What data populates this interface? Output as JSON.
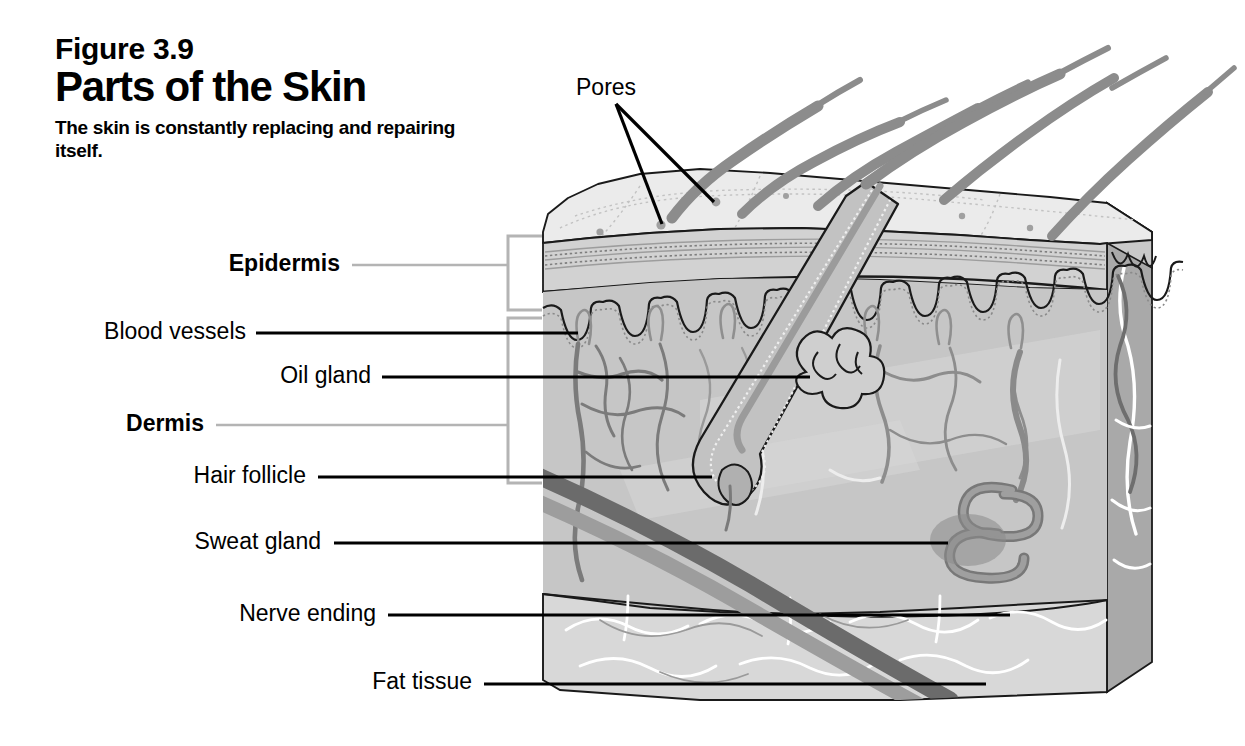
{
  "figure": {
    "number": "Figure 3.9",
    "title": "Parts of the Skin",
    "subtitle": "The skin is constantly replacing and repairing itself."
  },
  "colors": {
    "background": "#ffffff",
    "ink": "#000000",
    "leader_line": "#000000",
    "bracket_line": "#b4b4b4",
    "surface_top": "#ebebeb",
    "epidermis_band": "#b9b9b9",
    "epidermis_band_light": "#d2d2d2",
    "dermis": "#c6c6c6",
    "dermis_light": "#d0d0d0",
    "fat_tissue": "#d6d6d6",
    "side_face": "#a9a9a9",
    "hair": "#8c8c8c",
    "vessel_dark": "#6e6e6e",
    "vessel_mid": "#8f8f8f",
    "vessel_light": "#ffffff",
    "gland_dark": "#848484",
    "pore_dot": "#a0a0a0"
  },
  "labels": [
    {
      "id": "pores",
      "text": "Pores",
      "bold": false,
      "align": "left",
      "x": 576,
      "y": 76,
      "leader": "fan-black"
    },
    {
      "id": "epidermis",
      "text": "Epidermis",
      "bold": true,
      "align": "right",
      "x": 340,
      "y": 252,
      "leader": "gray"
    },
    {
      "id": "blood-vessels",
      "text": "Blood vessels",
      "bold": false,
      "align": "right",
      "x": 246,
      "y": 325,
      "leader": "black"
    },
    {
      "id": "oil-gland",
      "text": "Oil gland",
      "bold": false,
      "align": "right",
      "x": 371,
      "y": 366,
      "leader": "black"
    },
    {
      "id": "dermis",
      "text": "Dermis",
      "bold": true,
      "align": "right",
      "x": 204,
      "y": 415,
      "leader": "gray"
    },
    {
      "id": "hair-follicle",
      "text": "Hair follicle",
      "bold": false,
      "align": "right",
      "x": 306,
      "y": 467,
      "leader": "black"
    },
    {
      "id": "sweat-gland",
      "text": "Sweat gland",
      "bold": false,
      "align": "right",
      "x": 321,
      "y": 532,
      "leader": "black"
    },
    {
      "id": "nerve-ending",
      "text": "Nerve ending",
      "bold": false,
      "align": "right",
      "x": 376,
      "y": 605,
      "leader": "black"
    },
    {
      "id": "fat-tissue",
      "text": "Fat tissue",
      "bold": false,
      "align": "right",
      "x": 472,
      "y": 673,
      "leader": "black"
    }
  ],
  "brackets": [
    {
      "id": "epidermis-bracket",
      "label": "Epidermis",
      "top": 235,
      "bottom": 310,
      "x": 508
    },
    {
      "id": "dermis-bracket",
      "label": "Dermis",
      "top": 318,
      "bottom": 483,
      "x": 508
    }
  ],
  "structures": [
    {
      "id": "hair-shafts",
      "name": "hair shafts",
      "count": 6
    },
    {
      "id": "pore-openings",
      "name": "pore openings",
      "count": 2
    },
    {
      "id": "epidermis-layer",
      "name": "epidermis layer"
    },
    {
      "id": "dermis-layer",
      "name": "dermis layer"
    },
    {
      "id": "fat-layer",
      "name": "fat tissue layer"
    },
    {
      "id": "hair-follicle",
      "name": "hair follicle bulb"
    },
    {
      "id": "oil-gland",
      "name": "oil gland lobes"
    },
    {
      "id": "sweat-gland",
      "name": "coiled sweat gland"
    },
    {
      "id": "blood-vessels",
      "name": "blood vessel network"
    },
    {
      "id": "nerve-fibers",
      "name": "nerve fibers"
    }
  ]
}
